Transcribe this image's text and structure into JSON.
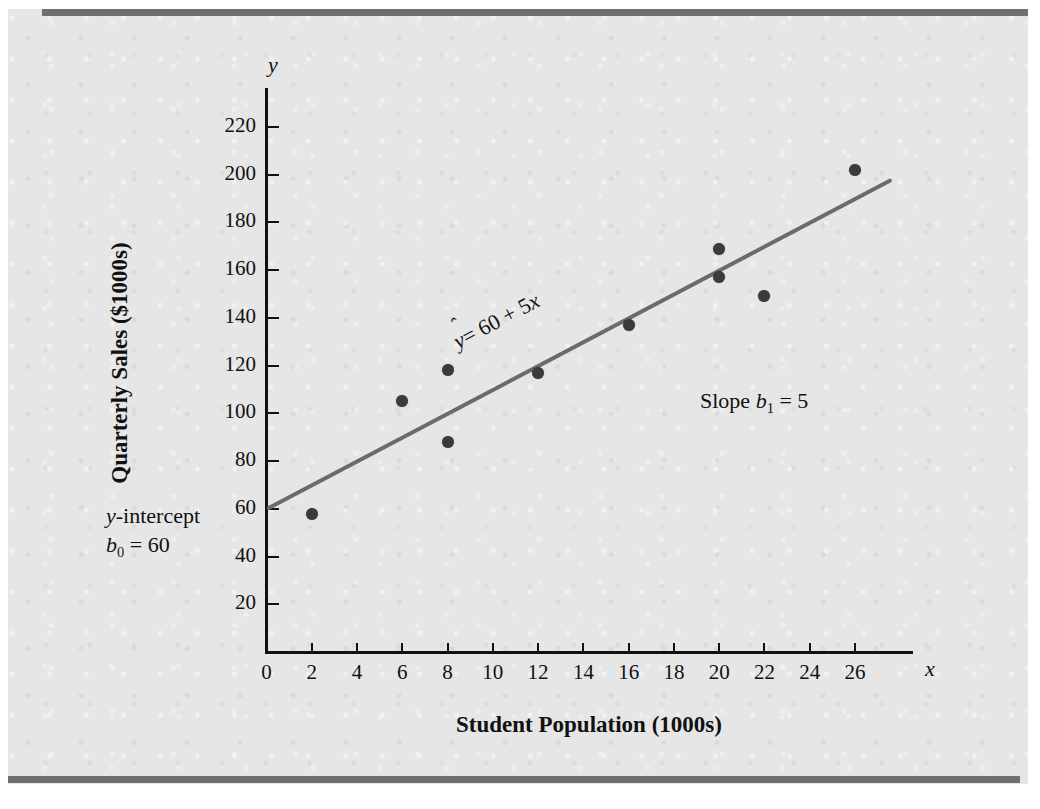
{
  "chart_data": {
    "type": "scatter",
    "title": "",
    "xlabel": "Student Population (1000s)",
    "ylabel": "Quarterly Sales ($1000s)",
    "x_axis_name": "x",
    "y_axis_name": "y",
    "xlim": [
      0,
      28
    ],
    "ylim": [
      0,
      232
    ],
    "grid": false,
    "legend": "none",
    "xticks": [
      0,
      2,
      4,
      6,
      8,
      10,
      12,
      14,
      16,
      18,
      20,
      22,
      24,
      26
    ],
    "yticks": [
      20,
      40,
      60,
      80,
      100,
      120,
      140,
      160,
      180,
      200,
      220
    ],
    "x": [
      2,
      6,
      8,
      8,
      12,
      16,
      20,
      20,
      22,
      26
    ],
    "y": [
      58,
      105,
      88,
      118,
      117,
      137,
      157,
      169,
      149,
      202
    ],
    "points": [
      {
        "x": 2,
        "y": 58
      },
      {
        "x": 6,
        "y": 105
      },
      {
        "x": 8,
        "y": 88
      },
      {
        "x": 8,
        "y": 118
      },
      {
        "x": 12,
        "y": 117
      },
      {
        "x": 16,
        "y": 137
      },
      {
        "x": 20,
        "y": 157
      },
      {
        "x": 20,
        "y": 169
      },
      {
        "x": 22,
        "y": 149
      },
      {
        "x": 26,
        "y": 202
      }
    ],
    "fit_line": {
      "intercept": 60,
      "slope": 5,
      "x_start": 0,
      "x_end": 27.6,
      "color": "#6b6b6b"
    },
    "point_color": "#3b3b3b",
    "annotations": {
      "equation": "ŷ = 60 + 5x",
      "equation_parts": {
        "lhs": "y",
        "rhs": "= 60 + 5",
        "var": "x"
      },
      "slope": "Slope b₁ = 5",
      "slope_parts": {
        "word": "Slope",
        "sym": "b",
        "sub": "1",
        "value": "= 5"
      },
      "intercept_line1": "y-intercept",
      "intercept_line2": "b₀ = 60",
      "intercept_parts": {
        "sym": "b",
        "sub": "0",
        "value": "= 60",
        "word": "-intercept",
        "ital": "y"
      }
    }
  },
  "colors": {
    "paper": "#e6e6e6",
    "band": "#6f6f6f",
    "axis": "#111111",
    "line": "#6b6b6b",
    "marker": "#3b3b3b"
  }
}
